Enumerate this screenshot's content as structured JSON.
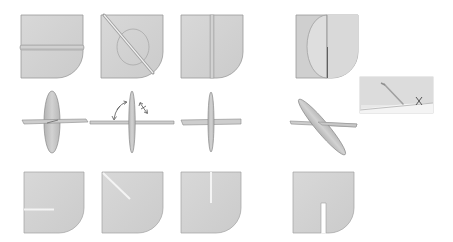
{
  "diagram": {
    "type": "assembly-instructions",
    "colors": {
      "background": "#ffffff",
      "card_fill": "#d4d4d4",
      "card_stroke": "#9a9a9a",
      "slot": "#f2f2f2",
      "fold_line": "#b0b0b0",
      "ring": "#a8a8a8",
      "inset_border": "#c8c8c8",
      "mark": "#555555"
    },
    "rows": [
      {
        "id": "row-1",
        "description": "Cards with fold/insertion lines",
        "items": [
          {
            "id": "card-horizontal-fold",
            "variant": "horizontal-fold"
          },
          {
            "id": "card-diagonal-fold-ring",
            "variant": "diagonal-fold-with-ring"
          },
          {
            "id": "card-vertical-fold",
            "variant": "vertical-fold"
          },
          {
            "id": "card-half-disc",
            "variant": "half-disc-insert"
          }
        ]
      },
      {
        "id": "row-2",
        "description": "Cross assemblies, rotation indicators",
        "items": [
          {
            "id": "cross-wide-disc",
            "variant": "wide-vertical-disc"
          },
          {
            "id": "cross-with-arrows",
            "variant": "rotation-arrows"
          },
          {
            "id": "cross-thin",
            "variant": "thin-vertical"
          },
          {
            "id": "cross-tilted",
            "variant": "tilted-perspective"
          }
        ],
        "inset": {
          "id": "inset-detail",
          "mark_label": "X"
        }
      },
      {
        "id": "row-3",
        "description": "Cards with cut slots",
        "items": [
          {
            "id": "slot-left-horizontal",
            "variant": "slot-from-left"
          },
          {
            "id": "slot-diagonal",
            "variant": "slot-from-top-left-diagonal"
          },
          {
            "id": "slot-top-vertical",
            "variant": "slot-from-top"
          },
          {
            "id": "slot-bottom-vertical",
            "variant": "slot-from-bottom"
          }
        ]
      }
    ]
  }
}
